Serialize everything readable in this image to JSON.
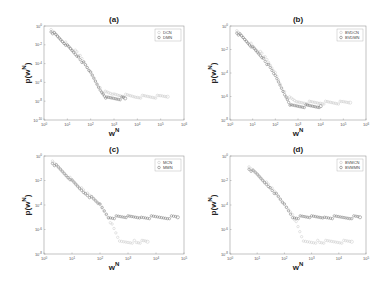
{
  "chart_data": [
    {
      "type": "scatter",
      "title": "(a)",
      "xlabel": "w^N",
      "ylabel": "p(w^N)",
      "xscale": "log",
      "yscale": "log",
      "xlim": [
        1,
        1000000
      ],
      "ylim": [
        1e-10,
        1
      ],
      "xticks": [
        "10^0",
        "10^1",
        "10^2",
        "10^3",
        "10^4",
        "10^5",
        "10^6"
      ],
      "yticks": [
        "10^0",
        "10^-2",
        "10^-4",
        "10^-6",
        "10^-8",
        "10^-10"
      ],
      "legend_position": "upper right",
      "series": [
        {
          "name": "DCN",
          "color": "#c8c8c8",
          "points": [
            [
              2,
              0.3
            ],
            [
              10,
              0.01
            ],
            [
              30,
              0.001
            ],
            [
              100,
              1e-05
            ],
            [
              300,
              1e-07
            ],
            [
              1000,
              5e-08
            ],
            [
              10000,
              3e-08
            ],
            [
              100000,
              3e-08
            ],
            [
              200000,
              3e-08
            ]
          ]
        },
        {
          "name": "DMN",
          "color": "#777777",
          "points": [
            [
              2,
              0.3
            ],
            [
              10,
              0.008
            ],
            [
              30,
              0.0006
            ],
            [
              100,
              1e-05
            ],
            [
              300,
              1e-07
            ],
            [
              500,
              2e-08
            ],
            [
              3000,
              2e-08
            ]
          ]
        }
      ]
    },
    {
      "type": "scatter",
      "title": "(b)",
      "xlabel": "w^N",
      "ylabel": "p(w^N)",
      "xscale": "log",
      "yscale": "log",
      "xlim": [
        1,
        1000000
      ],
      "ylim": [
        1e-08,
        1
      ],
      "xticks": [
        "10^0",
        "10^1",
        "10^2",
        "10^3",
        "10^4",
        "10^5",
        "10^6"
      ],
      "yticks": [
        "10^0",
        "10^-2",
        "10^-4",
        "10^-6",
        "10^-8"
      ],
      "legend_position": "upper right",
      "series": [
        {
          "name": "BVDCN",
          "color": "#c8c8c8",
          "points": [
            [
              2,
              0.3
            ],
            [
              10,
              0.02
            ],
            [
              30,
              0.003
            ],
            [
              100,
              0.0001
            ],
            [
              300,
              1e-06
            ],
            [
              1000,
              3e-07
            ],
            [
              10000,
              3e-07
            ],
            [
              100000,
              3e-07
            ],
            [
              200000,
              3e-07
            ]
          ]
        },
        {
          "name": "BVDMN",
          "color": "#777777",
          "points": [
            [
              2,
              0.3
            ],
            [
              10,
              0.015
            ],
            [
              30,
              0.002
            ],
            [
              100,
              5e-05
            ],
            [
              300,
              1e-06
            ],
            [
              500,
              1.5e-07
            ],
            [
              10000,
              1.5e-07
            ]
          ]
        }
      ]
    },
    {
      "type": "scatter",
      "title": "(c)",
      "xlabel": "w^N",
      "ylabel": "p(w^N)",
      "xscale": "log",
      "yscale": "log",
      "xlim": [
        1,
        100000
      ],
      "ylim": [
        1e-08,
        1
      ],
      "xticks": [
        "10^0",
        "10^1",
        "10^2",
        "10^3",
        "10^4",
        "10^5"
      ],
      "yticks": [
        "10^0",
        "10^-2",
        "10^-4",
        "10^-6",
        "10^-8"
      ],
      "legend_position": "upper right",
      "series": [
        {
          "name": "MCN",
          "color": "#c8c8c8",
          "points": [
            [
              2,
              0.3
            ],
            [
              10,
              0.01
            ],
            [
              30,
              0.001
            ],
            [
              100,
              0.0001
            ],
            [
              200,
              1e-05
            ],
            [
              500,
              1e-07
            ],
            [
              2000,
              1e-07
            ],
            [
              5000,
              1e-07
            ]
          ]
        },
        {
          "name": "MMN",
          "color": "#777777",
          "points": [
            [
              2,
              0.3
            ],
            [
              10,
              0.01
            ],
            [
              30,
              0.001
            ],
            [
              100,
              0.0001
            ],
            [
              200,
              1e-05
            ],
            [
              1000,
              1e-05
            ],
            [
              3000,
              1e-05
            ],
            [
              30000,
              1e-05
            ],
            [
              60000,
              1e-05
            ]
          ]
        }
      ]
    },
    {
      "type": "scatter",
      "title": "(d)",
      "xlabel": "w^N",
      "ylabel": "p(w^N)",
      "xscale": "log",
      "yscale": "log",
      "xlim": [
        1,
        100000
      ],
      "ylim": [
        1e-08,
        1
      ],
      "xticks": [
        "10^0",
        "10^1",
        "10^2",
        "10^3",
        "10^4",
        "10^5"
      ],
      "yticks": [
        "10^0",
        "10^-2",
        "10^-4",
        "10^-6",
        "10^-8"
      ],
      "legend_position": "upper right",
      "series": [
        {
          "name": "BVMCN",
          "color": "#c8c8c8",
          "points": [
            [
              5,
              0.1
            ],
            [
              10,
              0.03
            ],
            [
              30,
              0.003
            ],
            [
              100,
              0.0001
            ],
            [
              200,
              2e-05
            ],
            [
              500,
              1e-07
            ],
            [
              2000,
              1e-07
            ],
            [
              30000,
              1e-07
            ]
          ]
        },
        {
          "name": "BVMMN",
          "color": "#777777",
          "points": [
            [
              5,
              0.1
            ],
            [
              10,
              0.03
            ],
            [
              30,
              0.003
            ],
            [
              100,
              0.0001
            ],
            [
              200,
              1e-05
            ],
            [
              1000,
              1e-05
            ],
            [
              3000,
              1e-05
            ],
            [
              30000,
              1e-05
            ],
            [
              60000,
              1e-05
            ]
          ]
        }
      ]
    }
  ],
  "panels": [
    {
      "title": "(a)",
      "ylabel": "p(w",
      "ysup": "N",
      "xlabel": "w",
      "xsup": "N",
      "legend": [
        "DCN",
        "DMN"
      ]
    },
    {
      "title": "(b)",
      "ylabel": "p(w",
      "ysup": "N",
      "xlabel": "w",
      "xsup": "N",
      "legend": [
        "BVDCN",
        "BVDMN"
      ]
    },
    {
      "title": "(c)",
      "ylabel": "p(w",
      "ysup": "N",
      "xlabel": "w",
      "xsup": "N",
      "legend": [
        "MCN",
        "MMN"
      ]
    },
    {
      "title": "(d)",
      "ylabel": "p(w",
      "ysup": "N",
      "xlabel": "w",
      "xsup": "N",
      "legend": [
        "BVMCN",
        "BVMMN"
      ]
    }
  ]
}
